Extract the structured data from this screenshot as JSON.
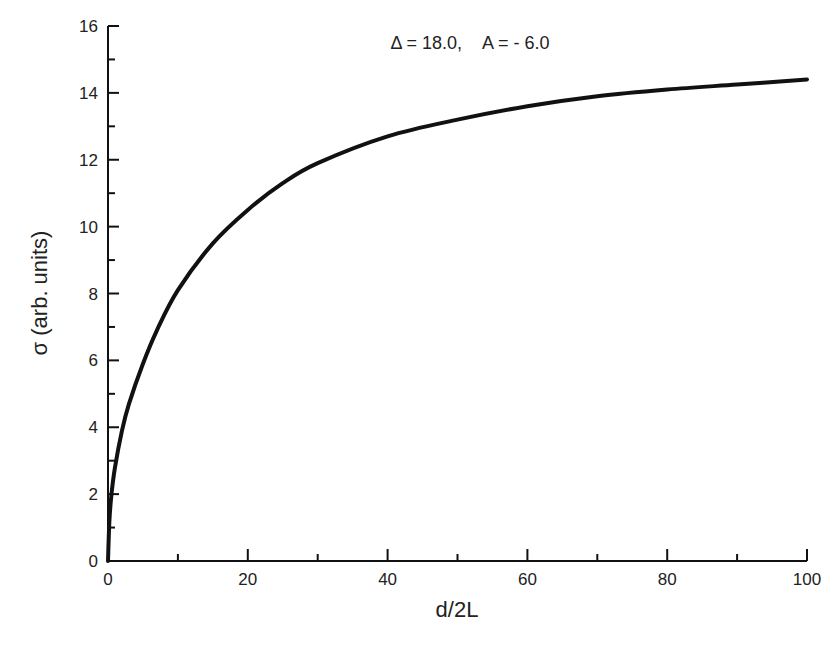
{
  "chart_data": {
    "type": "line",
    "title": "",
    "annotation": "Δ = 18.0,    A = - 6.0",
    "xlabel": "d/2L",
    "ylabel": "σ (arb. units)",
    "xlim": [
      0,
      100
    ],
    "ylim": [
      0,
      16
    ],
    "x_ticks": [
      0,
      20,
      40,
      60,
      80,
      100
    ],
    "x_minor_step": 10,
    "y_ticks": [
      0,
      2,
      4,
      6,
      8,
      10,
      12,
      14,
      16
    ],
    "y_minor_step": 1,
    "grid": false,
    "legend": null,
    "series": [
      {
        "name": "sigma",
        "color": "#111111",
        "x": [
          0,
          0.2,
          0.5,
          1,
          2,
          3,
          5,
          7,
          10,
          15,
          20,
          25,
          30,
          40,
          50,
          60,
          70,
          80,
          90,
          100
        ],
        "values": [
          0,
          1.2,
          2.0,
          2.8,
          3.9,
          4.7,
          5.9,
          6.9,
          8.1,
          9.5,
          10.5,
          11.3,
          11.9,
          12.7,
          13.2,
          13.6,
          13.9,
          14.1,
          14.25,
          14.4
        ]
      }
    ]
  },
  "labels": {
    "annotation": "Δ = 18.0,    A = - 6.0",
    "xlabel": "d/2L",
    "ylabel": "σ (arb. units)"
  }
}
